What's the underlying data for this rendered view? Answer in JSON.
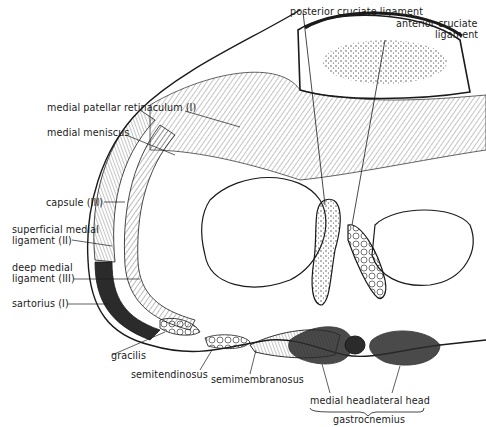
{
  "figure": {
    "labels": {
      "posterior_cruciate": "posterior cruciate ligament",
      "anterior_cruciate_1": "anterior cruciate",
      "anterior_cruciate_2": "ligament",
      "medial_patellar_retinaculum": "medial patellar retinaculum (I)",
      "medial_meniscus": "medial meniscus",
      "capsule": "capsule (III)",
      "superficial_medial_1": "superficial medial",
      "superficial_medial_2": "ligament (II)",
      "deep_medial_1": "deep medial",
      "deep_medial_2": "ligament (III)",
      "sartorius": "sartorius (I)",
      "gracilis": "gracilis",
      "semitendinosus": "semitendinosus",
      "semimembranosus": "semimembranosus",
      "medial_head": "medial head",
      "lateral_head": "lateral head",
      "gastrocnemius": "gastrocnemius"
    },
    "colors": {
      "ink": "#1a1a1a",
      "background": "#ffffff",
      "stipple": "#3a3a3a",
      "dark_muscle": "#2b2b2b"
    }
  }
}
